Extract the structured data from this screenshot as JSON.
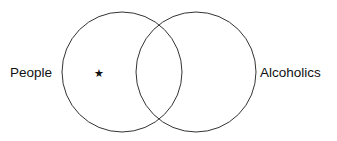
{
  "diagram": {
    "type": "venn",
    "sets": [
      {
        "label": "People",
        "cx": 122,
        "cy": 72,
        "r": 60
      },
      {
        "label": "Alcoholics",
        "cx": 196,
        "cy": 72,
        "r": 60
      }
    ],
    "marker": {
      "glyph": "★",
      "x": 99,
      "y": 72
    },
    "stroke_color": "#333333"
  }
}
